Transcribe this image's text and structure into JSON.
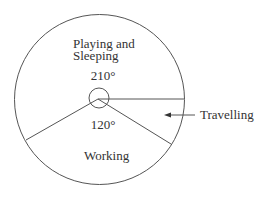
{
  "diagram": {
    "type": "pie-sector-diagram",
    "sectors": [
      {
        "name": "Playing and Sleeping",
        "label_lines": [
          "Playing and",
          "Sleeping"
        ],
        "angle_deg": 210
      },
      {
        "name": "Working",
        "label_lines": [
          "Working"
        ],
        "angle_deg": 120
      },
      {
        "name": "Travelling",
        "label_lines": [
          "Travelling"
        ],
        "angle_deg": 30
      }
    ],
    "angle_labels": {
      "top": "210°",
      "bottom": "120°"
    },
    "callout": {
      "text": "Travelling",
      "arrow": "left"
    },
    "colors": {
      "stroke": "#555555",
      "text": "#333333",
      "background": "#ffffff"
    }
  }
}
